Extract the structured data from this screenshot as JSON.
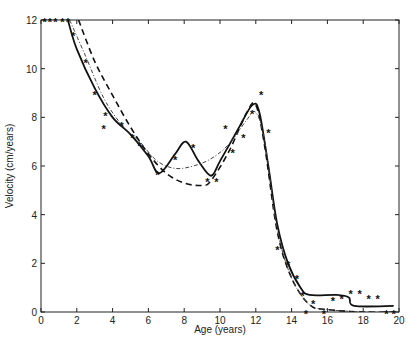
{
  "chart_data": {
    "type": "line",
    "title": "",
    "xlabel": "Age (years)",
    "ylabel": "Velocity (cm/years)",
    "xlim": [
      0,
      20
    ],
    "ylim": [
      0,
      12
    ],
    "xticks": [
      0,
      2,
      4,
      6,
      8,
      10,
      12,
      14,
      16,
      18,
      20
    ],
    "yticks": [
      0,
      2,
      4,
      6,
      8,
      10,
      12
    ],
    "grid": false,
    "legend": null,
    "series": [
      {
        "name": "observed",
        "style": "scatter-asterisk",
        "x": [
          0.2,
          0.5,
          0.8,
          1.2,
          1.5,
          1.8,
          2.5,
          3.0,
          3.5,
          3.6,
          4.5,
          5.1,
          5.5,
          6.5,
          7.5,
          8.5,
          9.3,
          9.8,
          10.3,
          10.7,
          11.3,
          11.8,
          12.3,
          12.7,
          13.2,
          13.8,
          14.3,
          14.6,
          14.8,
          15.2,
          15.8,
          16.3,
          16.8,
          17.3,
          17.8,
          18.3,
          18.8,
          19.3,
          19.7
        ],
        "y": [
          12,
          12,
          12,
          12,
          12,
          11.4,
          10.3,
          9.0,
          7.6,
          8.1,
          7.7,
          7.2,
          6.9,
          5.7,
          6.3,
          6.8,
          5.4,
          5.4,
          7.6,
          6.6,
          7.2,
          8.2,
          9.0,
          7.4,
          2.6,
          2.0,
          1.4,
          0.7,
          0.0,
          0.4,
          0.0,
          0.5,
          0.6,
          0.8,
          0.8,
          0.6,
          0.6,
          0.0,
          0.0
        ]
      },
      {
        "name": "fit (solid)",
        "style": "solid",
        "x": [
          1.5,
          2.0,
          3.0,
          4.0,
          5.0,
          6.0,
          6.6,
          7.5,
          8.1,
          8.8,
          9.5,
          10.0,
          11.0,
          11.8,
          12.2,
          12.7,
          13.2,
          13.8,
          14.5,
          15.0,
          16.5,
          17.2,
          17.5,
          19.7
        ],
        "y": [
          12,
          10.8,
          9.2,
          8.0,
          7.3,
          6.4,
          5.7,
          6.5,
          7.0,
          6.2,
          5.6,
          6.2,
          7.5,
          8.5,
          8.2,
          6.0,
          3.6,
          2.0,
          1.0,
          0.7,
          0.7,
          0.6,
          0.25,
          0.25
        ]
      },
      {
        "name": "fit (dashed)",
        "style": "dashed",
        "x": [
          2.1,
          3.0,
          4.0,
          5.0,
          6.0,
          7.0,
          8.0,
          9.0,
          9.5,
          10.5,
          11.5,
          12.0,
          12.5,
          13.2,
          14.0,
          15.0,
          16.0,
          18.0,
          20.0
        ],
        "y": [
          12,
          10.3,
          8.9,
          7.6,
          6.5,
          5.7,
          5.3,
          5.2,
          5.4,
          6.6,
          8.2,
          8.5,
          6.8,
          3.3,
          1.4,
          0.3,
          0.1,
          0.0,
          0.0
        ]
      },
      {
        "name": "fit (dash-dot)",
        "style": "dashdot",
        "x": [
          1.6,
          2.5,
          3.5,
          4.5,
          5.5,
          6.5,
          7.5,
          8.5,
          9.5,
          10.5,
          11.5,
          12.0,
          12.5,
          13.2,
          14.0,
          15.0,
          16.0,
          18.0,
          20.0
        ],
        "y": [
          12,
          10.5,
          8.8,
          7.7,
          7.0,
          6.2,
          5.9,
          6.0,
          6.3,
          6.9,
          7.9,
          8.2,
          7.0,
          3.4,
          1.4,
          0.3,
          0.1,
          0.0,
          0.0
        ]
      }
    ]
  }
}
